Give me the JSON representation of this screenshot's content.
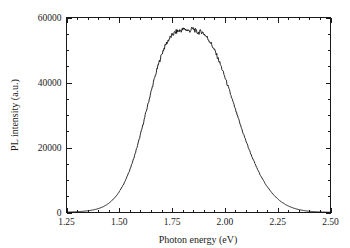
{
  "chart_data": {
    "type": "line",
    "title": "",
    "xlabel": "Photon energy (eV)",
    "ylabel": "PL intensity (a.u.)",
    "xlim": [
      1.25,
      2.5
    ],
    "ylim": [
      0,
      60000
    ],
    "grid": false,
    "legend": null,
    "x_ticks": [
      "1.25",
      "1.50",
      "1.75",
      "2.00",
      "2.25",
      "2.50"
    ],
    "x_tick_values": [
      1.25,
      1.5,
      1.75,
      2.0,
      2.25,
      2.5
    ],
    "x_minor_interval": 0.05,
    "y_ticks": [
      "0",
      "20000",
      "40000",
      "60000"
    ],
    "y_tick_values": [
      0,
      20000,
      40000,
      60000
    ],
    "y_minor_interval": 5000,
    "series_name": "PL emission",
    "peak_energy": 1.84,
    "peak_intensity": 56500,
    "fwhm": 0.3,
    "line_color": "#111111",
    "x": [
      1.25,
      1.27,
      1.29,
      1.31,
      1.33,
      1.35,
      1.37,
      1.39,
      1.41,
      1.43,
      1.45,
      1.47,
      1.49,
      1.51,
      1.53,
      1.55,
      1.57,
      1.59,
      1.61,
      1.63,
      1.65,
      1.67,
      1.69,
      1.71,
      1.73,
      1.75,
      1.77,
      1.79,
      1.81,
      1.83,
      1.85,
      1.87,
      1.89,
      1.91,
      1.93,
      1.95,
      1.97,
      1.99,
      2.01,
      2.03,
      2.05,
      2.07,
      2.09,
      2.11,
      2.13,
      2.15,
      2.17,
      2.19,
      2.21,
      2.23,
      2.25,
      2.27,
      2.29,
      2.31,
      2.33,
      2.35,
      2.37,
      2.39,
      2.41,
      2.43,
      2.45,
      2.47,
      2.5
    ],
    "values": [
      120,
      160,
      210,
      280,
      380,
      520,
      720,
      1000,
      1420,
      2000,
      2850,
      4000,
      5500,
      7500,
      10000,
      13200,
      17000,
      21500,
      26500,
      31800,
      37000,
      42000,
      46500,
      50200,
      52800,
      54500,
      55600,
      56000,
      56400,
      55900,
      56500,
      55400,
      55600,
      54300,
      52500,
      50000,
      47000,
      43500,
      39700,
      35700,
      31600,
      27600,
      23800,
      20200,
      16900,
      13900,
      11300,
      9000,
      7100,
      5500,
      4200,
      3150,
      2350,
      1720,
      1250,
      900,
      640,
      450,
      320,
      230,
      165,
      120,
      80
    ]
  }
}
